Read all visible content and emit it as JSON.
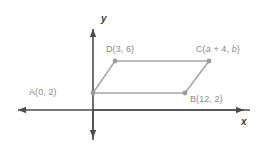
{
  "figure": {
    "type": "coordinate-plane-parallelogram",
    "axes": {
      "x_label": "x",
      "y_label": "y",
      "origin_px": [
        93,
        110
      ],
      "x_axis_span_px": [
        10,
        252
      ],
      "y_axis_span_px": [
        22,
        145
      ],
      "arrowheads": [
        "left",
        "right",
        "up",
        "down"
      ]
    },
    "shape": {
      "name": "parallelogram",
      "vertex_order": [
        "A",
        "B",
        "C",
        "D"
      ],
      "stroke_color": "#a6a6a6",
      "vertex_color": "#9a9a9a"
    },
    "points": [
      {
        "id": "A",
        "label": "A(0, 2)",
        "x": 0,
        "y": 2,
        "px": [
          93,
          93
        ],
        "label_pos": "left"
      },
      {
        "id": "B",
        "label": "B(12, 2)",
        "x": 12,
        "y": 2,
        "px": [
          185,
          93
        ],
        "label_pos": "right"
      },
      {
        "id": "C",
        "label": "C(a + 4, b)",
        "x": "a + 4",
        "y": "b",
        "px": [
          209,
          61
        ],
        "label_pos": "above-right"
      },
      {
        "id": "D",
        "label": "D(3, 6)",
        "x": 3,
        "y": 6,
        "px": [
          115,
          61
        ],
        "label_pos": "above-left"
      }
    ],
    "labels": {
      "A": "A(0, 2)",
      "B": "B(12, 2)",
      "C_prefix": "C(",
      "C_var1": "a",
      "C_mid": " + 4, ",
      "C_var2": "b",
      "C_suffix": ")",
      "D": "D(3, 6)"
    }
  },
  "colors": {
    "axis": "#4d4d4d",
    "shape_stroke": "#a6a6a6",
    "label_text": "#8a8a8a",
    "axis_label_text": "#3a3a3a",
    "background": "#ffffff"
  }
}
